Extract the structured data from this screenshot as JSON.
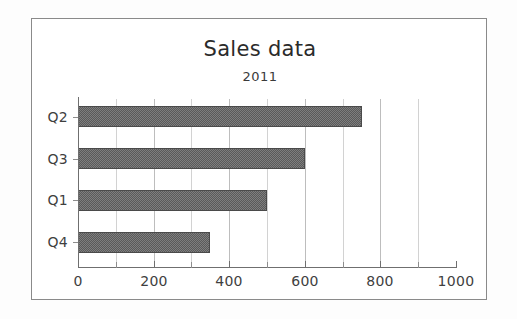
{
  "chart_data": {
    "type": "bar",
    "orientation": "horizontal",
    "title": "Sales data",
    "subtitle": "2011",
    "xlabel": "",
    "ylabel": "",
    "categories": [
      "Q2",
      "Q3",
      "Q1",
      "Q4"
    ],
    "values": [
      750,
      600,
      500,
      350
    ],
    "series": [
      {
        "name": "2011",
        "values": [
          750,
          600,
          500,
          350
        ]
      }
    ],
    "xlim": [
      0,
      1000
    ],
    "xticks": [
      0,
      200,
      400,
      600,
      800,
      1000
    ],
    "xtick_labels": [
      "0",
      "200",
      "400",
      "600",
      "800",
      "1000"
    ],
    "minor_xticks": [
      100,
      300,
      500,
      700,
      900
    ],
    "grid": true,
    "grid_axis": "x",
    "legend": false,
    "bar_color": "#5a5a5a",
    "grid_color": "#d2d2d2",
    "axis_color": "#6f6f6f",
    "frame_color": "#8a8a8a",
    "background_color": "#ffffff"
  }
}
